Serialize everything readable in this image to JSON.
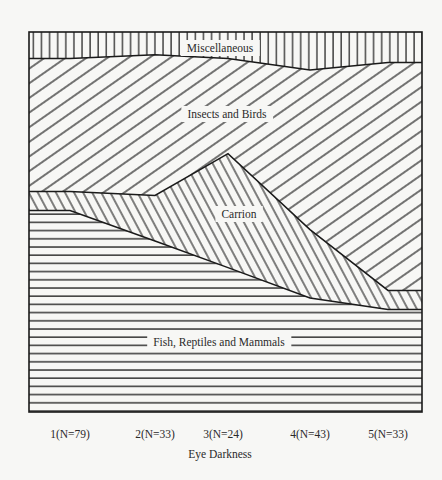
{
  "chart_data": {
    "type": "area",
    "stacked": true,
    "normalized_percent": true,
    "title": "",
    "xlabel": "Eye Darkness",
    "ylabel": "",
    "ylim": [
      0,
      100
    ],
    "grid": false,
    "legend": "inline labels",
    "categories": [
      "1(N=79)",
      "2(N=33)",
      "3(N=24)",
      "4(N=43)",
      "5(N=33)"
    ],
    "series": [
      {
        "name": "Fish, Reptiles and Mammals",
        "hatch": "horizontal",
        "values": [
          53,
          45,
          38,
          30,
          27
        ]
      },
      {
        "name": "Carrion",
        "hatch": "diagonal-back",
        "values": [
          5,
          12,
          30,
          18,
          5
        ]
      },
      {
        "name": "Insects and Birds",
        "hatch": "diagonal-forward",
        "values": [
          35,
          37,
          25,
          42,
          60
        ]
      },
      {
        "name": "Miscellaneous",
        "hatch": "vertical",
        "values": [
          7,
          6,
          7,
          10,
          8
        ]
      }
    ]
  },
  "colors": {
    "ink": "#1a1a1a",
    "paper": "#f7f7f5"
  }
}
